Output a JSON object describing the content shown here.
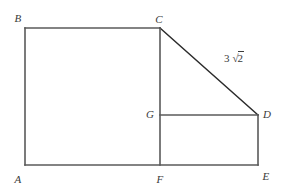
{
  "figure": {
    "type": "geometry-diagram",
    "shape_description": "Polygon A-B-C-D-E with interior segments C-F and G-D",
    "background_color": "#ffffff",
    "line_color": "#5a5a5a",
    "diagonal_color": "#2b2b2b",
    "label_color": "#3a3a3a",
    "vertices": [
      {
        "name": "A",
        "label": "A",
        "x": 25,
        "y": 165,
        "label_x": 18,
        "label_y": 179
      },
      {
        "name": "B",
        "label": "B",
        "x": 25,
        "y": 28,
        "label_x": 18,
        "label_y": 18
      },
      {
        "name": "C",
        "label": "C",
        "x": 160,
        "y": 28,
        "label_x": 159,
        "label_y": 19
      },
      {
        "name": "D",
        "label": "D",
        "x": 258,
        "y": 115,
        "label_x": 267,
        "label_y": 114
      },
      {
        "name": "E",
        "label": "E",
        "x": 258,
        "y": 165,
        "label_x": 266,
        "label_y": 176
      },
      {
        "name": "F",
        "label": "F",
        "x": 160,
        "y": 165,
        "label_x": 160,
        "label_y": 179
      },
      {
        "name": "G",
        "label": "G",
        "x": 160,
        "y": 115,
        "label_x": 150,
        "label_y": 114
      }
    ],
    "segments": [
      {
        "name": "segment-AB",
        "from": "A",
        "to": "B",
        "style": "outline"
      },
      {
        "name": "segment-BC",
        "from": "B",
        "to": "C",
        "style": "outline"
      },
      {
        "name": "segment-CD",
        "from": "C",
        "to": "D",
        "style": "diagonal"
      },
      {
        "name": "segment-DE",
        "from": "D",
        "to": "E",
        "style": "outline"
      },
      {
        "name": "segment-EA",
        "from": "E",
        "to": "A",
        "style": "outline"
      },
      {
        "name": "segment-CF",
        "from": "C",
        "to": "F",
        "style": "interior"
      },
      {
        "name": "segment-GD",
        "from": "G",
        "to": "D",
        "style": "interior"
      }
    ],
    "measurements": [
      {
        "name": "length-CD",
        "applies_to": "segment-CD",
        "coefficient": "3",
        "radical_symbol": "√",
        "radicand": "2",
        "text": "3√2",
        "label_x": 234,
        "label_y": 58
      }
    ]
  }
}
